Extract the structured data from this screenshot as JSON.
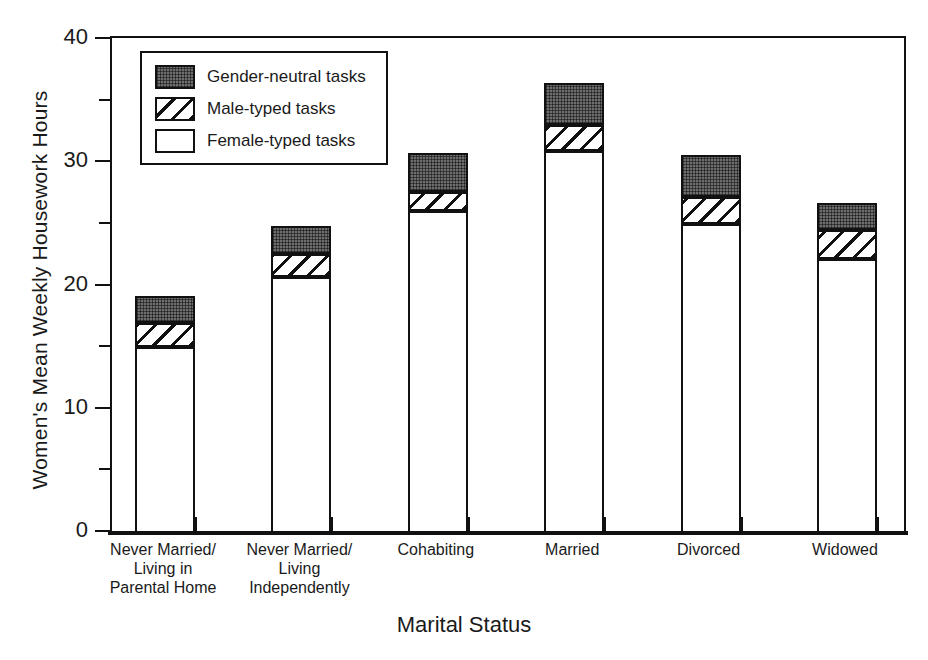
{
  "chart_data": {
    "type": "bar",
    "subtype": "stacked-vertical",
    "title": "",
    "xlabel": "Marital Status",
    "ylabel": "Women's Mean Weekly Housework Hours",
    "ylim": [
      0,
      40
    ],
    "yticks": [
      0,
      10,
      20,
      30,
      40
    ],
    "yticks_minor": [
      5,
      15,
      25,
      35
    ],
    "ytick_labels": [
      "0",
      "10",
      "20",
      "30",
      "40"
    ],
    "grid": false,
    "legend_position": "upper-left-inside",
    "categories": [
      "Never Married/\nLiving in\nParental Home",
      "Never Married/\nLiving\nIndependently",
      "Cohabiting",
      "Married",
      "Divorced",
      "Widowed"
    ],
    "category_lines": [
      [
        "Never Married/",
        "Living in",
        "Parental Home"
      ],
      [
        "Never Married/",
        "Living",
        "Independently"
      ],
      [
        "Cohabiting"
      ],
      [
        "Married"
      ],
      [
        "Divorced"
      ],
      [
        "Widowed"
      ]
    ],
    "series": [
      {
        "name": "Female-typed tasks",
        "key": "female",
        "values": [
          15.1,
          20.8,
          26.1,
          31.0,
          25.1,
          22.2
        ]
      },
      {
        "name": "Male-typed tasks",
        "key": "male",
        "values": [
          1.9,
          1.8,
          1.6,
          2.1,
          2.2,
          2.4
        ]
      },
      {
        "name": "Gender-neutral tasks",
        "key": "neutral",
        "values": [
          2.2,
          2.3,
          3.1,
          3.5,
          3.4,
          2.2
        ]
      }
    ],
    "cumulative_tops": {
      "female": [
        15.1,
        20.8,
        26.1,
        31.0,
        25.1,
        22.2
      ],
      "male": [
        17.0,
        22.6,
        27.7,
        33.1,
        27.3,
        24.6
      ],
      "neutral": [
        19.2,
        24.9,
        30.8,
        36.5,
        30.7,
        26.8
      ]
    },
    "totals": [
      19.2,
      24.9,
      30.8,
      36.5,
      30.7,
      26.8
    ]
  },
  "legend": {
    "items": [
      {
        "label": "Gender-neutral tasks",
        "pattern": "dotted-dark-fill",
        "color": "#6e6e6e"
      },
      {
        "label": "Male-typed tasks",
        "pattern": "diagonal-hatch",
        "color": "#ffffff"
      },
      {
        "label": "Female-typed tasks",
        "pattern": "solid-white",
        "color": "#ffffff"
      }
    ]
  },
  "axes": {
    "y_title": "Women's Mean Weekly Housework Hours",
    "x_title": "Marital Status"
  },
  "colors": {
    "ink": "#111111",
    "neutral_fill": "#6e6e6e",
    "background": "#ffffff"
  }
}
